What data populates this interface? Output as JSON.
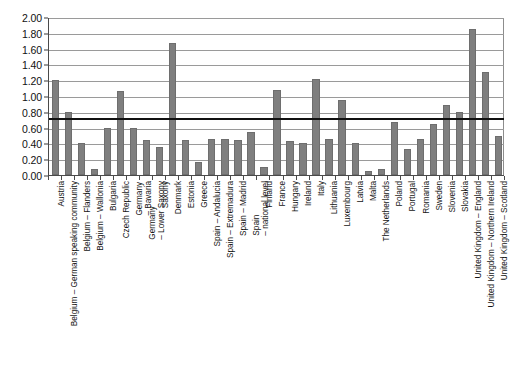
{
  "chart_data": {
    "type": "bar",
    "title": "",
    "xlabel": "",
    "ylabel": "",
    "ylim": [
      0.0,
      2.0
    ],
    "y_tick_step": 0.2,
    "grid": true,
    "legend": "none",
    "bar_color": "#7f7f7f",
    "reference_line": {
      "value": 0.74,
      "color": "#111111",
      "label": ""
    },
    "y_ticks": [
      "0.00",
      "0.20",
      "0.40",
      "0.60",
      "0.80",
      "1.00",
      "1.20",
      "1.40",
      "1.60",
      "1.80",
      "2.00"
    ],
    "categories": [
      "Austria",
      "Belgium – German speaking community",
      "Belgium – Flanders",
      "Belgium – Wallonia",
      "Bulgaria",
      "Czech Republic",
      "Germany – Bavaria",
      "Germany – Lower Saxony",
      "Germany – Saxony",
      "Denmark",
      "Estonia",
      "Greece",
      "Spain – Andalucia",
      "Spain – Extremadura",
      "Spain – Madrid",
      "Spain – national level",
      "Finland",
      "France",
      "Hungary",
      "Ireland",
      "Italy",
      "Lithuania",
      "Luxembourg",
      "Latvia",
      "Malta",
      "The Netherlands",
      "Poland",
      "Portugal",
      "Romania",
      "Sweden",
      "Slovenia",
      "Slovakia",
      "United Kingdom – England",
      "United Kingdom – Northern Ireland",
      "United Kingdom – Scotland"
    ],
    "category_label_lines": [
      [
        "Austria",
        ""
      ],
      [
        "Belgium – German speaking community",
        ""
      ],
      [
        "Belgium – Flanders",
        ""
      ],
      [
        "Belgium – Wallonia",
        ""
      ],
      [
        "Bulgaria",
        ""
      ],
      [
        "Czech Republic",
        ""
      ],
      [
        "Germany",
        "– Bavaria"
      ],
      [
        "Germany",
        "– Lower Saxony"
      ],
      [
        "Saxony",
        ""
      ],
      [
        "Denmark",
        ""
      ],
      [
        "Estonia",
        ""
      ],
      [
        "Greece",
        ""
      ],
      [
        "Spain – Andalucia",
        ""
      ],
      [
        "Spain – Extremadura",
        ""
      ],
      [
        "Spain – Madrid",
        ""
      ],
      [
        "Spain",
        "– national level"
      ],
      [
        "Finland",
        ""
      ],
      [
        "France",
        ""
      ],
      [
        "Hungary",
        ""
      ],
      [
        "Ireland",
        ""
      ],
      [
        "Italy",
        ""
      ],
      [
        "Lithuania",
        ""
      ],
      [
        "Luxembourg",
        ""
      ],
      [
        "Latvia",
        ""
      ],
      [
        "Malta",
        ""
      ],
      [
        "The Netherlands",
        ""
      ],
      [
        "Poland",
        ""
      ],
      [
        "Portugal",
        ""
      ],
      [
        "Romania",
        ""
      ],
      [
        "Sweden",
        ""
      ],
      [
        "Slovenia",
        ""
      ],
      [
        "Slovakia",
        ""
      ],
      [
        "United Kingdom – England",
        ""
      ],
      [
        "United Kingdom – Northern Ireland",
        ""
      ],
      [
        "United Kingdom – Scotland",
        ""
      ]
    ],
    "values": [
      1.2,
      0.8,
      0.41,
      0.07,
      0.6,
      1.06,
      0.6,
      0.44,
      0.35,
      1.67,
      0.44,
      0.17,
      0.45,
      0.46,
      0.44,
      0.54,
      0.1,
      1.07,
      0.43,
      0.4,
      1.21,
      0.45,
      0.95,
      0.41,
      0.05,
      0.07,
      0.67,
      0.33,
      0.45,
      0.65,
      0.88,
      0.8,
      1.85,
      1.31,
      0.5
    ]
  }
}
